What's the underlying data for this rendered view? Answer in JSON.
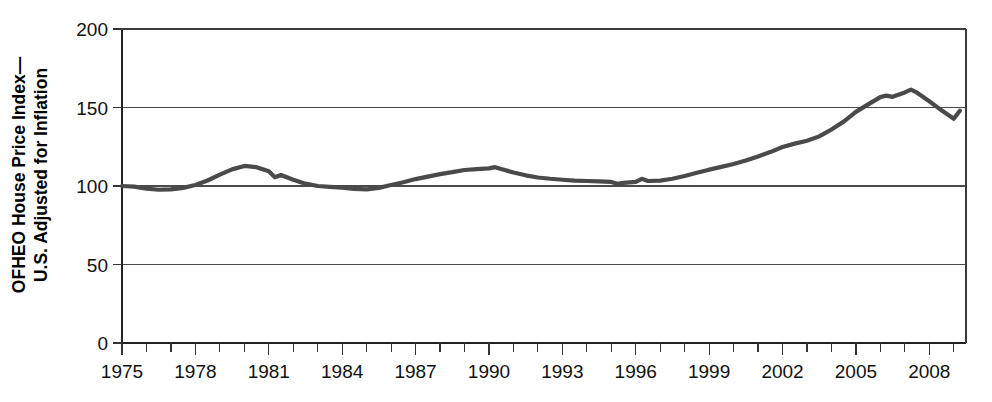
{
  "chart_data": {
    "type": "line",
    "title": "",
    "xlabel": "",
    "ylabel": "OFHEO House Price Index—U.S. Adjusted for Inflation",
    "ylabel_line1": "OFHEO House Price Index—",
    "ylabel_line2": "U.S. Adjusted for Inflation",
    "xlim": [
      1975,
      2009.5
    ],
    "ylim": [
      0,
      200
    ],
    "yticks": [
      0,
      50,
      100,
      150,
      200
    ],
    "ytick_labels": [
      "0",
      "50",
      "100",
      "150",
      "200"
    ],
    "xticks": [
      1975,
      1978,
      1981,
      1984,
      1987,
      1990,
      1993,
      1996,
      1999,
      2002,
      2005,
      2008
    ],
    "xtick_labels": [
      "1975",
      "1978",
      "1981",
      "1984",
      "1987",
      "1990",
      "1993",
      "1996",
      "1999",
      "2002",
      "2005",
      "2008"
    ],
    "x_minor_tick_interval": 1,
    "grid": true,
    "grid_axis": "y",
    "legend": "none",
    "line_color": "#4a4a4a",
    "series": [
      {
        "name": "OFHEO House Price Index (U.S., inflation adjusted)",
        "x": [
          1975.0,
          1975.5,
          1976.0,
          1976.5,
          1977.0,
          1977.5,
          1978.0,
          1978.5,
          1979.0,
          1979.5,
          1980.0,
          1980.5,
          1981.0,
          1981.25,
          1981.5,
          1982.0,
          1982.5,
          1983.0,
          1983.5,
          1984.0,
          1984.5,
          1985.0,
          1985.5,
          1986.0,
          1986.5,
          1987.0,
          1987.5,
          1988.0,
          1988.5,
          1989.0,
          1989.5,
          1990.0,
          1990.25,
          1990.5,
          1991.0,
          1991.5,
          1992.0,
          1992.5,
          1993.0,
          1993.5,
          1994.0,
          1994.5,
          1995.0,
          1995.25,
          1995.5,
          1996.0,
          1996.25,
          1996.5,
          1997.0,
          1997.5,
          1998.0,
          1998.5,
          1999.0,
          1999.5,
          2000.0,
          2000.5,
          2001.0,
          2001.5,
          2002.0,
          2002.5,
          2003.0,
          2003.5,
          2004.0,
          2004.5,
          2005.0,
          2005.5,
          2006.0,
          2006.25,
          2006.5,
          2007.0,
          2007.25,
          2007.5,
          2008.0,
          2008.5,
          2009.0,
          2009.25
        ],
        "y": [
          100.0,
          99.6,
          98.3,
          97.6,
          97.8,
          98.8,
          100.6,
          103.5,
          107.2,
          110.6,
          112.8,
          112.0,
          109.4,
          105.6,
          107.0,
          104.0,
          101.5,
          100.0,
          99.5,
          99.0,
          98.2,
          97.8,
          98.8,
          100.6,
          102.4,
          104.4,
          106.0,
          107.6,
          108.8,
          110.2,
          110.8,
          111.2,
          112.0,
          110.8,
          108.6,
          106.8,
          105.4,
          104.6,
          104.0,
          103.4,
          103.2,
          103.0,
          102.6,
          101.4,
          102.0,
          102.6,
          104.6,
          103.2,
          103.4,
          104.6,
          106.4,
          108.4,
          110.4,
          112.2,
          114.0,
          116.2,
          118.8,
          121.6,
          124.8,
          127.0,
          128.8,
          131.6,
          136.0,
          141.0,
          147.2,
          152.0,
          156.6,
          157.6,
          156.8,
          159.6,
          161.4,
          159.4,
          154.0,
          148.2,
          142.8,
          148.0
        ]
      }
    ]
  }
}
